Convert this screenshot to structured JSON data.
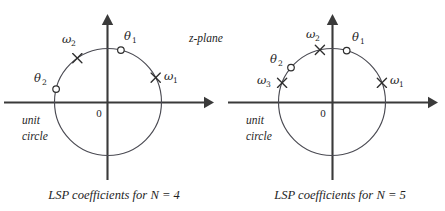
{
  "figure": {
    "title_text": "z-plane",
    "background_color": "#ffffff",
    "axis_color": "#3a3a3a",
    "circle_color": "#4a4a52",
    "marker_color": "#2e2e2e"
  },
  "panels": [
    {
      "id": "panel-left",
      "caption": "LSP coefficients for N = 4",
      "plane_label": "z-plane",
      "origin_label": "0",
      "unit_circle_label_line1": "unit",
      "unit_circle_label_line2": "circle",
      "center": {
        "x": 108,
        "y": 102
      },
      "radius": 53.5,
      "axes": {
        "x_start": 4,
        "x_end": 212,
        "y_start": 180,
        "y_end": 16
      },
      "markers": [
        {
          "name": "theta-1",
          "symbol": "θ",
          "subscript": "1",
          "marker_type": "circle",
          "angle_deg": 76,
          "x": 120.9,
          "y": 50.1,
          "label_x": 124,
          "label_y": 40
        },
        {
          "name": "omega-2",
          "symbol": "ω",
          "subscript": "2",
          "marker_type": "cross",
          "angle_deg": 125,
          "x": 77.3,
          "y": 58.2,
          "label_x": 60,
          "label_y": 43
        },
        {
          "name": "theta-2",
          "symbol": "θ",
          "subscript": "2",
          "marker_type": "circle",
          "angle_deg": 166,
          "x": 56.1,
          "y": 89.1,
          "label_x": 25,
          "label_y": 80
        },
        {
          "name": "omega-1",
          "symbol": "ω",
          "subscript": "1",
          "marker_type": "cross",
          "angle_deg": 27,
          "x": 155.7,
          "y": 77.7,
          "label_x": 163,
          "label_y": 80
        }
      ]
    },
    {
      "id": "panel-right",
      "caption": "LSP coefficients for N = 5",
      "plane_label": "",
      "origin_label": "0",
      "unit_circle_label_line1": "unit",
      "unit_circle_label_line2": "circle",
      "center": {
        "x": 332,
        "y": 102
      },
      "radius": 53.5,
      "axes": {
        "x_start": 228,
        "x_end": 437,
        "y_start": 180,
        "y_end": 16
      },
      "markers": [
        {
          "name": "theta-1",
          "symbol": "θ",
          "subscript": "1",
          "marker_type": "circle",
          "angle_deg": 74,
          "x": 346.7,
          "y": 50.6,
          "label_x": 352,
          "label_y": 41
        },
        {
          "name": "omega-2",
          "symbol": "ω",
          "subscript": "2",
          "marker_type": "cross",
          "angle_deg": 103,
          "x": 319.9,
          "y": 49.9,
          "label_x": 304,
          "label_y": 39
        },
        {
          "name": "theta-2",
          "symbol": "θ",
          "subscript": "2",
          "marker_type": "circle",
          "angle_deg": 140,
          "x": 291.0,
          "y": 67.6,
          "label_x": 264,
          "label_y": 63
        },
        {
          "name": "omega-3",
          "symbol": "ω",
          "subscript": "3",
          "marker_type": "cross",
          "angle_deg": 159,
          "x": 282.1,
          "y": 82.8,
          "label_x": 255,
          "label_y": 84
        },
        {
          "name": "omega-1",
          "symbol": "ω",
          "subscript": "1",
          "marker_type": "cross",
          "angle_deg": 21,
          "x": 381.9,
          "y": 82.8,
          "label_x": 390,
          "label_y": 84
        }
      ]
    }
  ]
}
